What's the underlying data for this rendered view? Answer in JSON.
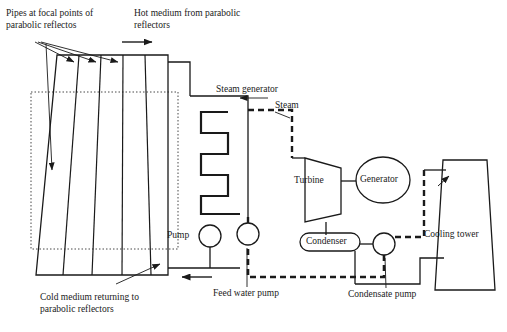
{
  "diagram": {
    "labels": {
      "pipes_focal": "Pipes at focal points of\nparabolic reflectos",
      "hot_medium": "Hot medium from parabolic\nreflectors",
      "steam_generator": "Steam generator",
      "steam": "Steam",
      "turbine": "Turbine",
      "generator": "Generator",
      "condenser": "Condenser",
      "cooling_tower": "Cooling tower",
      "pump": "Pump",
      "feed_water_pump": "Feed water pump",
      "condensate_pump": "Condensate pump",
      "cold_medium": "Cold medium returning to\nparabolic reflectors"
    },
    "colors": {
      "line": "#1a1a1a",
      "dashed": "#1a1a1a",
      "background": "#ffffff",
      "fill": "none"
    },
    "components": [
      {
        "id": "solar-field",
        "label": "Pipes at focal points of parabolic reflectos"
      },
      {
        "id": "steam-generator",
        "label": "Steam generator"
      },
      {
        "id": "turbine",
        "label": "Turbine"
      },
      {
        "id": "generator",
        "label": "Generator"
      },
      {
        "id": "condenser",
        "label": "Condenser"
      },
      {
        "id": "cooling-tower",
        "label": "Cooling tower"
      },
      {
        "id": "pump",
        "label": "Pump"
      },
      {
        "id": "feed-water-pump",
        "label": "Feed water pump"
      },
      {
        "id": "condensate-pump",
        "label": "Condensate pump"
      }
    ]
  }
}
